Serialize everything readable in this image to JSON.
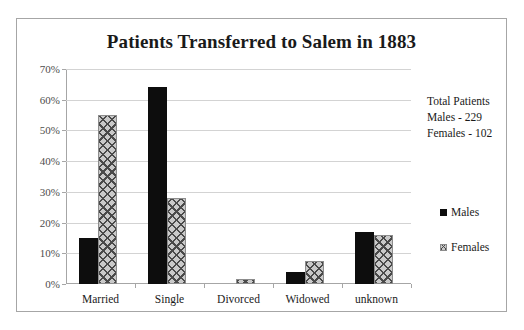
{
  "chart_data": {
    "type": "bar",
    "title": "Patients Transferred to Salem in 1883",
    "xlabel": "",
    "ylabel": "",
    "categories": [
      "Married",
      "Single",
      "Divorced",
      "Widowed",
      "unknown"
    ],
    "series": [
      {
        "name": "Males",
        "values": [
          15,
          64,
          0,
          4,
          17
        ]
      },
      {
        "name": "Females",
        "values": [
          55,
          28,
          1.5,
          7.5,
          16
        ]
      }
    ],
    "ylim": [
      0,
      70
    ],
    "yticks": [
      70,
      60,
      50,
      40,
      30,
      20,
      10,
      0
    ],
    "ytick_labels": [
      "70%",
      "60%",
      "50%",
      "40%",
      "30%",
      "20%",
      "10%",
      "0%"
    ],
    "value_unit": "%",
    "grid": true,
    "legend_position": "right",
    "legend": [
      "Males",
      "Females"
    ],
    "annotations": [
      "Total Patients",
      "Males - 229",
      "Females - 102"
    ],
    "colors": {
      "males": "#0d0d0d",
      "females_fill": "#c9c9c9",
      "females_hatch": "#4a4a4a",
      "gridline": "#d3d3d3",
      "axis": "#a6a6a6",
      "text": "#1a1a1a",
      "tick_text": "#4d4d4d",
      "background": "#ffffff",
      "frame": "#a6a6a6"
    }
  },
  "annotation_block": {
    "line1": "Total Patients",
    "line2": "Males - 229",
    "line3": "Females - 102"
  },
  "legend_items": {
    "males": "Males",
    "females": "Females"
  }
}
